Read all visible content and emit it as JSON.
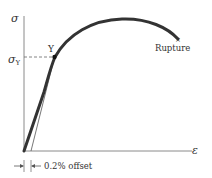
{
  "diagram": {
    "y_axis_label": "σ",
    "x_axis_label": "ε",
    "yield_stress_label": "σ",
    "yield_stress_subscript": "Y",
    "yield_point_label": "Y",
    "rupture_label": "Rupture",
    "offset_label": "0.2% offset",
    "colors": {
      "curve": "#333333",
      "axis": "#888888",
      "offset_line": "#555555",
      "dashed": "#666666",
      "point": "#111111"
    }
  }
}
